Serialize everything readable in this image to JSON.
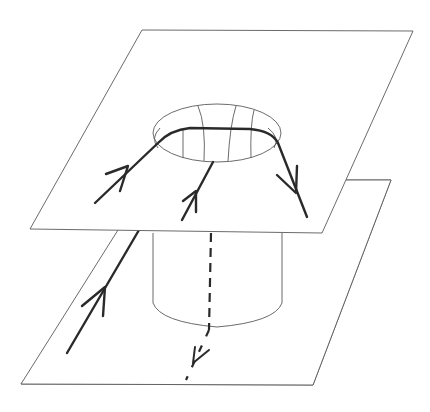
{
  "figure": {
    "colors": {
      "line": "#2a2a2a",
      "outline": "#5a5a5a",
      "background": "#ffffff"
    },
    "elements": {
      "upper_sheet": "upper-plane",
      "lower_sheet": "lower-plane",
      "hole_rim": "ellipse-with-meridians",
      "tube": "cylinder",
      "flow_lines": [
        "left-line-upper",
        "middle-line-upper",
        "right-line-upper",
        "left-line-lower",
        "dashed-line-through-tube"
      ]
    }
  }
}
